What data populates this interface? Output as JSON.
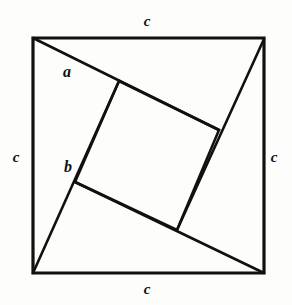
{
  "figure": {
    "name": "pythagorean-theorem-square-diagram",
    "background_color": "#fdfdfb",
    "stroke_color": "#111111",
    "outer_stroke_width": 3.2,
    "inner_stroke_width": 2.6,
    "outer_square": {
      "left": 33,
      "top": 38,
      "right": 264,
      "bottom": 273,
      "side_px": 231
    },
    "inner_square_vertices": {
      "top": {
        "x": 119,
        "y": 81
      },
      "right": {
        "x": 219,
        "y": 130
      },
      "bottom": {
        "x": 177,
        "y": 230
      },
      "left": {
        "x": 75,
        "y": 182
      }
    },
    "chords": [
      {
        "name": "chord-top-left-to-right-side",
        "x1": 33,
        "y1": 38,
        "x2": 219,
        "y2": 130
      },
      {
        "name": "chord-top-right-to-bottom-side",
        "x1": 264,
        "y1": 39,
        "x2": 177,
        "y2": 230
      },
      {
        "name": "chord-bottom-right-to-left-side",
        "x1": 264,
        "y1": 273,
        "x2": 75,
        "y2": 182
      },
      {
        "name": "chord-bottom-left-to-top-side",
        "x1": 33,
        "y1": 273,
        "x2": 119,
        "y2": 81
      }
    ],
    "labels": {
      "leg_a": {
        "text": "a",
        "x": 67,
        "y": 72
      },
      "leg_b": {
        "text": "b",
        "x": 68,
        "y": 167
      },
      "side_top": {
        "text": "c",
        "x": 147,
        "y": 21
      },
      "side_left": {
        "text": "c",
        "x": 16,
        "y": 157
      },
      "side_right": {
        "text": "c",
        "x": 274,
        "y": 157
      },
      "side_bottom": {
        "text": "c",
        "x": 147,
        "y": 289
      }
    }
  }
}
